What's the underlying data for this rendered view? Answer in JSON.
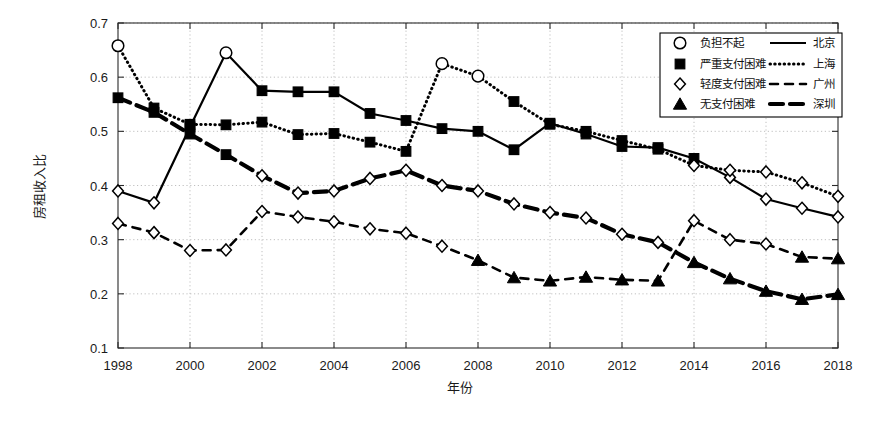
{
  "chart_data": {
    "type": "line",
    "title": "",
    "xlabel": "年份",
    "ylabel": "房租收入比",
    "xlim": [
      1998,
      2018
    ],
    "ylim": [
      0.1,
      0.7
    ],
    "ytick_labels": [
      "0.1",
      "0.2",
      "0.3",
      "0.4",
      "0.5",
      "0.6",
      "0.7"
    ],
    "ytick_values": [
      0.1,
      0.2,
      0.3,
      0.4,
      0.5,
      0.6,
      0.7
    ],
    "xtick_labels": [
      "1998",
      "2000",
      "2002",
      "2004",
      "2006",
      "2008",
      "2010",
      "2012",
      "2014",
      "2016",
      "2018"
    ],
    "xtick_values": [
      1998,
      2000,
      2002,
      2004,
      2006,
      2008,
      2010,
      2012,
      2014,
      2016,
      2018
    ],
    "grid": true,
    "grid_style": "dotted",
    "legend_position": "top-right",
    "x": [
      1998,
      1999,
      2000,
      2001,
      2002,
      2003,
      2004,
      2005,
      2006,
      2007,
      2008,
      2009,
      2010,
      2011,
      2012,
      2013,
      2014,
      2015,
      2016,
      2017,
      2018
    ],
    "series": [
      {
        "name": "北京",
        "line_style": "solid",
        "values": [
          0.39,
          0.368,
          0.508,
          0.645,
          0.575,
          0.573,
          0.573,
          0.533,
          0.52,
          0.505,
          0.5,
          0.466,
          0.515,
          0.495,
          0.472,
          0.47,
          0.45,
          0.415,
          0.375,
          0.358,
          0.342
        ]
      },
      {
        "name": "上海",
        "line_style": "dotted",
        "values": [
          0.658,
          0.543,
          0.513,
          0.512,
          0.517,
          0.494,
          0.496,
          0.48,
          0.463,
          0.625,
          0.602,
          0.555,
          0.513,
          0.5,
          0.483,
          0.467,
          0.437,
          0.428,
          0.425,
          0.405,
          0.38
        ]
      },
      {
        "name": "广州",
        "line_style": "dashed",
        "values": [
          0.33,
          0.313,
          0.28,
          0.281,
          0.352,
          0.342,
          0.333,
          0.32,
          0.312,
          0.288,
          0.262,
          0.23,
          0.224,
          0.231,
          0.226,
          0.224,
          0.335,
          0.3,
          0.292,
          0.268,
          0.265
        ]
      },
      {
        "name": "深圳",
        "line_style": "thick-dashed",
        "values": [
          0.562,
          0.535,
          0.495,
          0.457,
          0.418,
          0.386,
          0.39,
          0.413,
          0.428,
          0.4,
          0.39,
          0.366,
          0.35,
          0.34,
          0.31,
          0.295,
          0.258,
          0.228,
          0.205,
          0.19,
          0.199
        ]
      }
    ],
    "marker_legend": [
      {
        "marker": "circle",
        "label": "负担不起"
      },
      {
        "marker": "square",
        "label": "严重支付困难"
      },
      {
        "marker": "diamond",
        "label": "轻度支付困难"
      },
      {
        "marker": "triangle",
        "label": "无支付困难"
      }
    ],
    "marker_rule": {
      "circle_min": 0.6,
      "square_min": 0.45,
      "diamond_min": 0.28,
      "triangle_below": 0.28
    },
    "colors": {
      "line": "#000000",
      "grid": "#b9b9b9",
      "axis": "#2a2a2a",
      "background": "#ffffff"
    }
  },
  "legend": {
    "marker_column": [
      "负担不起",
      "严重支付困难",
      "轻度支付困难",
      "无支付困难"
    ],
    "line_column": [
      "北京",
      "上海",
      "广州",
      "深圳"
    ]
  }
}
